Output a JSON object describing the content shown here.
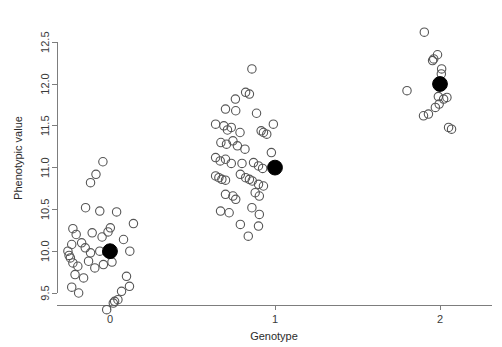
{
  "chart_data": {
    "type": "scatter",
    "title": "",
    "xlabel": "Genotype",
    "ylabel": "Phenotypic value",
    "xlim": [
      -0.38,
      2.38
    ],
    "ylim": [
      9.15,
      12.72
    ],
    "xticks": [
      0,
      1,
      2
    ],
    "xticklabels": [
      "0",
      "1",
      "2"
    ],
    "yticks": [
      9.5,
      10.0,
      10.5,
      11.0,
      11.5,
      12.0,
      12.5
    ],
    "yticklabels": [
      "9.5",
      "10.0",
      "10.5",
      "11.0",
      "11.5",
      "12.0",
      "12.5"
    ],
    "grid": false,
    "legend": null,
    "marker_open": "open-circle",
    "marker_mean": "filled-circle",
    "series": [
      {
        "name": "Individual phenotypes",
        "marker": "open-circle",
        "color": "#555555",
        "points": [
          [
            -0.085,
            10.92
          ],
          [
            -0.118,
            10.82
          ],
          [
            -0.043,
            11.07
          ],
          [
            -0.148,
            10.52
          ],
          [
            -0.062,
            10.48
          ],
          [
            0.04,
            10.47
          ],
          [
            -0.225,
            10.27
          ],
          [
            -0.205,
            10.2
          ],
          [
            -0.108,
            10.22
          ],
          [
            -0.048,
            10.17
          ],
          [
            -0.012,
            10.23
          ],
          [
            0.002,
            10.28
          ],
          [
            -0.232,
            10.08
          ],
          [
            -0.255,
            10.0
          ],
          [
            -0.248,
            9.95
          ],
          [
            -0.24,
            9.92
          ],
          [
            -0.172,
            10.1
          ],
          [
            -0.15,
            10.04
          ],
          [
            -0.118,
            9.98
          ],
          [
            -0.062,
            10.0
          ],
          [
            -0.02,
            9.99
          ],
          [
            -0.225,
            9.86
          ],
          [
            -0.195,
            9.82
          ],
          [
            -0.13,
            9.88
          ],
          [
            -0.092,
            9.8
          ],
          [
            -0.04,
            9.84
          ],
          [
            0.012,
            9.87
          ],
          [
            -0.212,
            9.72
          ],
          [
            -0.16,
            9.68
          ],
          [
            -0.232,
            9.57
          ],
          [
            -0.19,
            9.5
          ],
          [
            0.082,
            10.14
          ],
          [
            0.12,
            10.0
          ],
          [
            0.1,
            9.7
          ],
          [
            0.07,
            9.52
          ],
          [
            0.048,
            9.42
          ],
          [
            0.028,
            9.4
          ],
          [
            0.02,
            9.38
          ],
          [
            -0.02,
            9.3
          ],
          [
            0.118,
            9.58
          ],
          [
            0.142,
            10.33
          ],
          [
            0.76,
            11.82
          ],
          [
            0.822,
            11.9
          ],
          [
            0.845,
            11.88
          ],
          [
            0.7,
            11.7
          ],
          [
            0.762,
            11.68
          ],
          [
            0.888,
            11.65
          ],
          [
            0.64,
            11.52
          ],
          [
            0.69,
            11.5
          ],
          [
            0.712,
            11.45
          ],
          [
            0.735,
            11.48
          ],
          [
            0.788,
            11.42
          ],
          [
            0.916,
            11.44
          ],
          [
            0.93,
            11.42
          ],
          [
            0.95,
            11.4
          ],
          [
            0.672,
            11.3
          ],
          [
            0.706,
            11.28
          ],
          [
            0.745,
            11.32
          ],
          [
            0.772,
            11.26
          ],
          [
            0.818,
            11.22
          ],
          [
            0.64,
            11.12
          ],
          [
            0.668,
            11.08
          ],
          [
            0.7,
            11.1
          ],
          [
            0.735,
            11.05
          ],
          [
            0.8,
            11.05
          ],
          [
            0.87,
            11.06
          ],
          [
            0.9,
            11.02
          ],
          [
            0.925,
            10.99
          ],
          [
            0.64,
            10.9
          ],
          [
            0.66,
            10.88
          ],
          [
            0.678,
            10.86
          ],
          [
            0.7,
            10.85
          ],
          [
            0.79,
            10.92
          ],
          [
            0.822,
            10.88
          ],
          [
            0.845,
            10.86
          ],
          [
            0.862,
            10.84
          ],
          [
            0.9,
            10.8
          ],
          [
            0.93,
            10.78
          ],
          [
            0.7,
            10.68
          ],
          [
            0.745,
            10.66
          ],
          [
            0.762,
            10.62
          ],
          [
            0.88,
            10.7
          ],
          [
            0.905,
            10.66
          ],
          [
            0.67,
            10.48
          ],
          [
            0.722,
            10.46
          ],
          [
            0.86,
            10.52
          ],
          [
            0.905,
            10.44
          ],
          [
            0.79,
            10.32
          ],
          [
            0.9,
            10.3
          ],
          [
            0.838,
            10.18
          ],
          [
            0.99,
            11.52
          ],
          [
            0.978,
            11.18
          ],
          [
            0.86,
            12.18
          ],
          [
            1.905,
            12.62
          ],
          [
            1.985,
            12.35
          ],
          [
            1.962,
            12.3
          ],
          [
            1.955,
            12.28
          ],
          [
            2.01,
            12.18
          ],
          [
            2.008,
            12.12
          ],
          [
            1.8,
            11.92
          ],
          [
            1.99,
            11.85
          ],
          [
            2.022,
            11.82
          ],
          [
            2.042,
            11.84
          ],
          [
            1.995,
            11.76
          ],
          [
            1.972,
            11.72
          ],
          [
            1.9,
            11.62
          ],
          [
            1.93,
            11.64
          ],
          [
            2.052,
            11.48
          ],
          [
            2.07,
            11.46
          ]
        ]
      },
      {
        "name": "Genotype means",
        "marker": "filled-circle",
        "color": "#000000",
        "points": [
          [
            0.0,
            10.0
          ],
          [
            1.0,
            11.0
          ],
          [
            2.0,
            12.0
          ]
        ]
      }
    ]
  },
  "geometry": {
    "plot_left": 57,
    "plot_right": 492,
    "plot_top": 12,
    "plot_bottom": 305,
    "x_pixel_at_0": 110,
    "x_pixel_per_unit": 165,
    "y_pixel_at_9_5": 293,
    "y_pixel_per_unit": 83.6,
    "open_radius": 4.2,
    "mean_radius": 7.4
  }
}
